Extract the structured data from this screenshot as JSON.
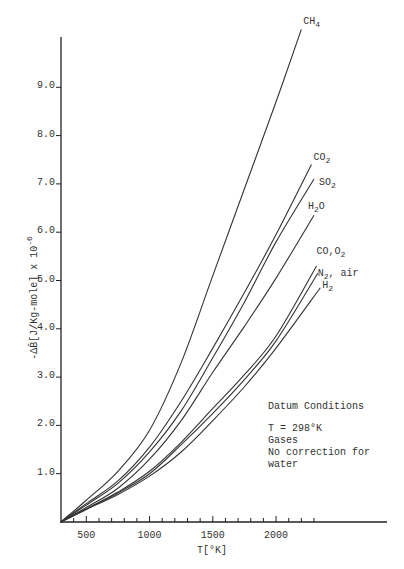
{
  "chart_data": {
    "type": "line",
    "title": "",
    "xlabel": "T[°K]",
    "ylabel": "-ΔB̄[J/Kg-mole] x 10^-6",
    "xlim": [
      300,
      3000
    ],
    "ylim": [
      0,
      10.3
    ],
    "grid": false,
    "legend": "inline labels at curve ends",
    "x_ticks": [
      500,
      1000,
      1500,
      2000
    ],
    "x_minor_step": 100,
    "y_ticks": [
      1.0,
      2.0,
      3.0,
      4.0,
      5.0,
      6.0,
      7.0,
      8.0,
      9.0
    ],
    "y_tick_labels": [
      "1.0",
      "2.0",
      "3.0",
      "4.0",
      "5.0",
      "6.0",
      "7.0",
      "8.0",
      "9.0"
    ],
    "x_tick_labels": [
      "500",
      "1000",
      "1500",
      "2000"
    ],
    "series": [
      {
        "name": "CH4",
        "label": "CH",
        "sub": "4",
        "x": [
          298,
          500,
          750,
          1000,
          1250,
          1500,
          1750,
          2000,
          2200
        ],
        "values": [
          0,
          0.45,
          1.05,
          1.9,
          3.3,
          5.1,
          6.9,
          8.7,
          10.2
        ]
      },
      {
        "name": "CO2",
        "label": "CO",
        "sub": "2",
        "x": [
          298,
          500,
          750,
          1000,
          1250,
          1500,
          1750,
          2000,
          2280
        ],
        "values": [
          0,
          0.38,
          0.85,
          1.55,
          2.5,
          3.6,
          4.75,
          5.95,
          7.4
        ]
      },
      {
        "name": "SO2",
        "label": "SO",
        "sub": "2",
        "x": [
          298,
          500,
          750,
          1000,
          1250,
          1500,
          1750,
          2000,
          2300
        ],
        "values": [
          0,
          0.35,
          0.8,
          1.45,
          2.3,
          3.4,
          4.55,
          5.8,
          7.1
        ]
      },
      {
        "name": "H2O",
        "label": "H",
        "sub": "2",
        "suffix": "O",
        "x": [
          298,
          500,
          750,
          1000,
          1250,
          1500,
          1750,
          2000,
          2300
        ],
        "values": [
          0,
          0.3,
          0.7,
          1.3,
          2.1,
          3.1,
          4.05,
          5.05,
          6.35
        ]
      },
      {
        "name": "CO,O2",
        "label": "CO,O",
        "sub": "2",
        "x": [
          298,
          500,
          750,
          1000,
          1250,
          1500,
          1750,
          2000,
          2320
        ],
        "values": [
          0,
          0.27,
          0.62,
          1.05,
          1.65,
          2.35,
          3.05,
          3.85,
          5.3
        ]
      },
      {
        "name": "N2, air",
        "label": "N",
        "sub": "2",
        "suffix": ", air",
        "x": [
          298,
          500,
          750,
          1000,
          1250,
          1500,
          1750,
          2000,
          2330
        ],
        "values": [
          0,
          0.27,
          0.6,
          1.0,
          1.6,
          2.25,
          2.95,
          3.75,
          5.15
        ]
      },
      {
        "name": "H2",
        "label": "H",
        "sub": "2",
        "x": [
          298,
          500,
          750,
          1000,
          1250,
          1500,
          1750,
          2000,
          2350
        ],
        "values": [
          0,
          0.26,
          0.57,
          0.95,
          1.45,
          2.1,
          2.8,
          3.6,
          4.85
        ]
      }
    ],
    "annotation": {
      "heading": "Datum Conditions",
      "lines": [
        "T = 298°K",
        "Gases",
        "No correction for",
        "water"
      ]
    }
  },
  "labels": {
    "xlabel": "T[°K]",
    "ylabel_main": "-ΔB̄[J/Kg-mole] x 10",
    "ylabel_exp": "-6",
    "note_heading": "Datum Conditions",
    "note_line1": "T = 298°K",
    "note_line2": "Gases",
    "note_line3": "No correction for",
    "note_line4": "water"
  }
}
